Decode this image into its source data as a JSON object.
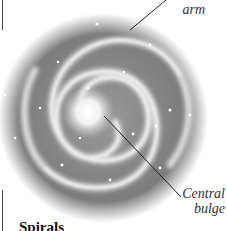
{
  "diagram": {
    "labels": {
      "arm_top_fragment": "",
      "arm": "arm",
      "bulge_line1": "Central",
      "bulge_line2": "bulge"
    },
    "heading": "Spirals",
    "colors": {
      "disk": "#7a7a7a",
      "arm_glow": "#e8e8e8",
      "core": "#ffffff",
      "leader_line": "#222222"
    }
  }
}
